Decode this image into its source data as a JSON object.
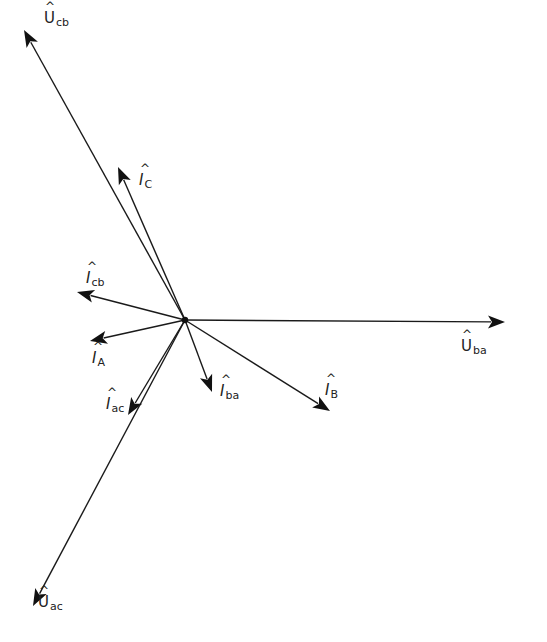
{
  "diagram": {
    "title": "",
    "type": "phasor-diagram",
    "origin": {
      "x": 185,
      "y": 320
    },
    "line_color": "#1a1a1a",
    "background": "#ffffff",
    "vectors": [
      {
        "id": "U_cb",
        "symbol": "U",
        "subscript": "cb",
        "kind": "voltage",
        "tip": {
          "x": 24,
          "y": 30
        }
      },
      {
        "id": "I_C",
        "symbol": "I",
        "subscript": "C",
        "kind": "current",
        "tip": {
          "x": 118,
          "y": 167
        }
      },
      {
        "id": "I_cb",
        "symbol": "I",
        "subscript": "cb",
        "kind": "current",
        "tip": {
          "x": 77,
          "y": 292
        }
      },
      {
        "id": "I_A",
        "symbol": "I",
        "subscript": "A",
        "kind": "current",
        "tip": {
          "x": 90,
          "y": 341
        }
      },
      {
        "id": "I_ac",
        "symbol": "I",
        "subscript": "ac",
        "kind": "current",
        "tip": {
          "x": 128,
          "y": 415
        }
      },
      {
        "id": "I_ba",
        "symbol": "I",
        "subscript": "ba",
        "kind": "current",
        "tip": {
          "x": 212,
          "y": 392
        }
      },
      {
        "id": "I_B",
        "symbol": "I",
        "subscript": "B",
        "kind": "current",
        "tip": {
          "x": 330,
          "y": 411
        }
      },
      {
        "id": "U_ba",
        "symbol": "U",
        "subscript": "ba",
        "kind": "voltage",
        "tip": {
          "x": 505,
          "y": 322
        }
      },
      {
        "id": "U_ac",
        "symbol": "U",
        "subscript": "ac",
        "kind": "voltage",
        "tip": {
          "x": 33,
          "y": 606
        }
      }
    ]
  },
  "labels": {
    "U_cb": {
      "hat": "^",
      "symbol": "U",
      "sub": "cb"
    },
    "I_C": {
      "hat": "^",
      "symbol": "I",
      "sub": "C"
    },
    "I_cb": {
      "hat": "^",
      "symbol": "I",
      "sub": "cb"
    },
    "I_A": {
      "hat": "^",
      "symbol": "I",
      "sub": "A"
    },
    "I_ac": {
      "hat": "^",
      "symbol": "I",
      "sub": "ac"
    },
    "I_ba": {
      "hat": "^",
      "symbol": "I",
      "sub": "ba"
    },
    "I_B": {
      "hat": "^",
      "symbol": "I",
      "sub": "B"
    },
    "U_ba": {
      "hat": "^",
      "symbol": "U",
      "sub": "ba"
    },
    "U_ac": {
      "hat": "^",
      "symbol": "U",
      "sub": "ac"
    }
  }
}
